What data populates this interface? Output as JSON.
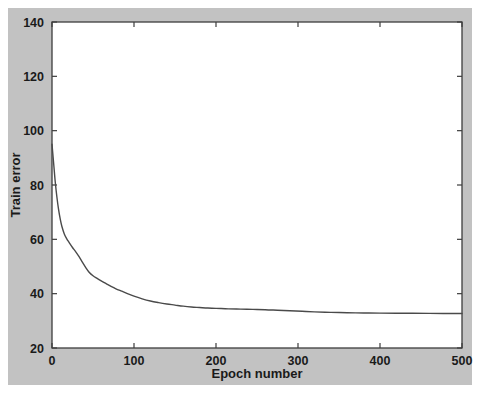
{
  "figure": {
    "background_color": "#c2c2c2",
    "plot_background_color": "#ffffff",
    "axis_color": "#3d3d3d",
    "grid_color": "#9a9a9a",
    "line_color": "#4a4a4a"
  },
  "chart_data": {
    "type": "line",
    "title": "",
    "xlabel": "Epoch number",
    "ylabel": "Train error",
    "xlim": [
      0,
      500
    ],
    "ylim": [
      20,
      140
    ],
    "xticks": [
      0,
      100,
      200,
      300,
      400,
      500
    ],
    "yticks": [
      20,
      40,
      60,
      80,
      100,
      120,
      140
    ],
    "xtick_labels": [
      "0",
      "100",
      "200",
      "300",
      "400",
      "500"
    ],
    "ytick_labels": [
      "20",
      "40",
      "60",
      "80",
      "100",
      "120",
      "140"
    ],
    "grid": true,
    "grid_style": "dotted",
    "legend": null,
    "legend_position": "none",
    "series": [
      {
        "name": "Train error",
        "x": [
          0,
          2,
          4,
          6,
          8,
          10,
          12,
          15,
          18,
          21,
          25,
          29,
          33,
          37,
          41,
          45,
          50,
          55,
          60,
          66,
          72,
          78,
          85,
          92,
          100,
          110,
          120,
          130,
          140,
          150,
          160,
          170,
          180,
          190,
          200,
          215,
          230,
          245,
          260,
          275,
          290,
          305,
          320,
          340,
          360,
          380,
          400,
          430,
          460,
          500
        ],
        "y": [
          95.0,
          88.0,
          81.0,
          75.5,
          71.0,
          67.5,
          64.8,
          62.0,
          60.2,
          58.8,
          57.0,
          55.4,
          53.6,
          51.6,
          49.7,
          48.0,
          46.6,
          45.6,
          44.7,
          43.7,
          42.7,
          41.8,
          40.9,
          40.0,
          39.1,
          38.1,
          37.3,
          36.7,
          36.2,
          35.8,
          35.4,
          35.1,
          34.9,
          34.7,
          34.6,
          34.4,
          34.3,
          34.2,
          34.1,
          33.9,
          33.7,
          33.5,
          33.3,
          33.1,
          33.0,
          32.9,
          32.85,
          32.8,
          32.75,
          32.7
        ]
      }
    ]
  }
}
